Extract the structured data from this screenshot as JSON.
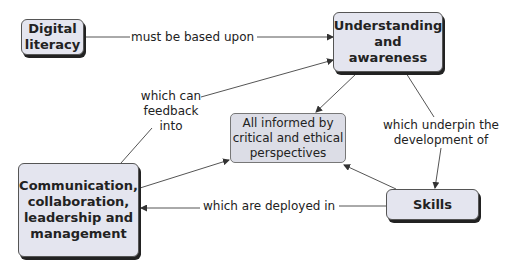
{
  "nodes": {
    "digital_literacy": "Digital literacy",
    "understanding": "Understanding and awareness",
    "central": "All informed by critical and ethical perspectives",
    "communication": "Communication, collaboration, leadership and management",
    "skills": "Skills"
  },
  "links": {
    "based_upon": "must be based upon",
    "feedback": "which can feedback into",
    "underpin": "which underpin the development of",
    "deployed": "which are deployed in"
  },
  "colors": {
    "node_fill": "#e4e5ef",
    "border": "#555555",
    "line": "#444444"
  }
}
